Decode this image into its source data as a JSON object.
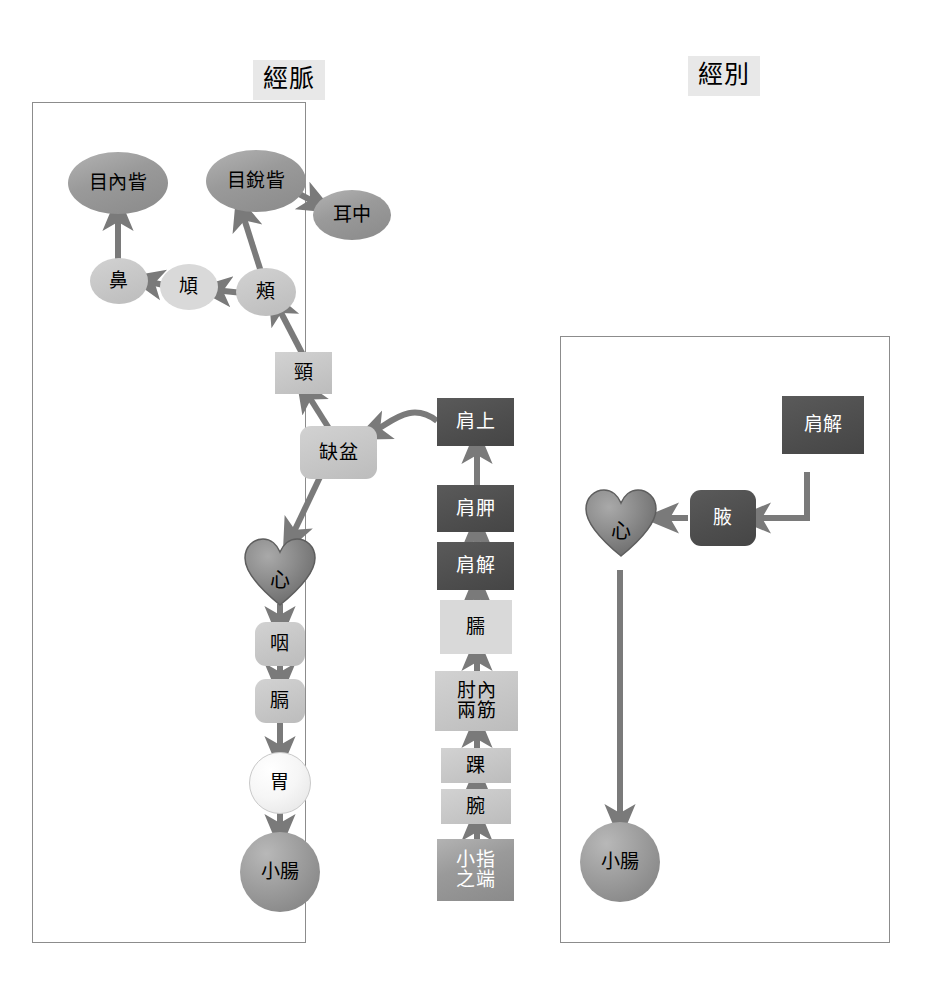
{
  "panels": {
    "meridian": {
      "caption": "經脈"
    },
    "divergent": {
      "caption": "經別"
    }
  },
  "meridian_nodes": {
    "inner_canthus": "目內眥",
    "outer_canthus": "目銳眥",
    "ear_middle": "耳中",
    "nose": "鼻",
    "cheekbone": "頄",
    "cheek": "頰",
    "neck": "頸",
    "supraclavicular_fossa": "缺盆",
    "heart": "心",
    "throat": "咽",
    "diaphragm": "膈",
    "stomach": "胃",
    "small_intestine": "小腸",
    "shoulder_top": "肩上",
    "scapula": "肩胛",
    "shoulder_joint": "肩解",
    "upper_arm": "臑",
    "elbow_two_tendons": "肘內\n兩筋",
    "elbow_two_tendons_line1": "肘內",
    "elbow_two_tendons_line2": "兩筋",
    "ankle_wrist_bone": "踝",
    "wrist": "腕",
    "little_finger_tip_line1": "小指",
    "little_finger_tip_line2": "之端"
  },
  "divergent_nodes": {
    "shoulder_joint": "肩解",
    "axilla": "腋",
    "heart": "心",
    "small_intestine": "小腸"
  },
  "colors": {
    "dark_fill": "#4d4d4d",
    "mid_fill": "#9a9a9a",
    "light_fill": "#c6c6c6",
    "pale_fill": "#d9d9d9",
    "white_fill": "#f4f4f4",
    "caption_bg": "#e8e8e8",
    "panel_border": "#8c8c8c",
    "connector": "#7a7a7a",
    "text_dark": "#000000",
    "text_light": "#ffffff"
  }
}
